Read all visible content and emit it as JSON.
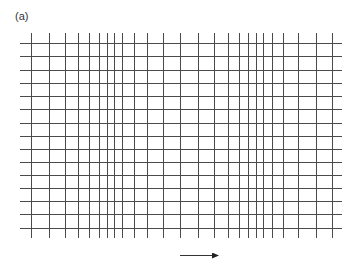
{
  "figure": {
    "panel_label": "(a)",
    "line_color": "#4a4a4a",
    "vertical_lines_x": [
      31,
      49,
      65,
      78,
      89,
      99,
      107,
      114,
      122,
      134,
      147,
      163,
      180,
      198,
      214,
      228,
      239,
      248,
      256,
      263,
      272,
      283,
      298,
      316,
      332
    ],
    "vertical_y_range": [
      33,
      238
    ],
    "horizontal_lines_y": [
      43,
      56,
      70,
      83,
      96,
      109,
      123,
      136,
      149,
      162,
      175,
      188,
      201,
      214,
      228
    ],
    "horizontal_x_range": [
      20,
      342
    ],
    "arrow": {
      "x1": 180,
      "x2": 223,
      "y": 255,
      "direction": "right"
    }
  }
}
